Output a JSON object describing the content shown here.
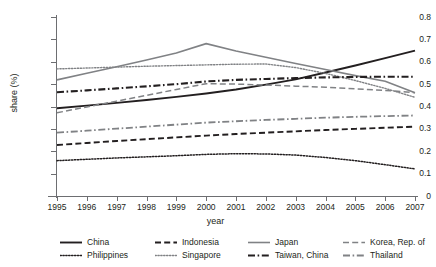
{
  "chart_data": {
    "type": "line",
    "title": "",
    "xlabel": "year",
    "ylabel": "share (%)",
    "x": [
      1995,
      1996,
      1997,
      1998,
      1999,
      2000,
      2001,
      2002,
      2003,
      2004,
      2005,
      2006,
      2007
    ],
    "xtick_labels": [
      "1995",
      "1996",
      "1997",
      "1998",
      "1999",
      "2000",
      "2001",
      "2002",
      "2003",
      "2004",
      "2005",
      "2006",
      "2007"
    ],
    "ytick_labels": [
      "0",
      "0.1",
      "0.2",
      "0.3",
      "0.4",
      "0.5",
      "0.6",
      "0.7",
      "0.8"
    ],
    "ylim": [
      0,
      0.8
    ],
    "xlim": [
      1995,
      2007
    ],
    "grid": false,
    "legend_position": "bottom",
    "series": [
      {
        "name": "China",
        "style": "solid",
        "color": "#231f20",
        "width": 1.9,
        "values": [
          0.392,
          0.404,
          0.416,
          0.429,
          0.443,
          0.458,
          0.476,
          0.498,
          0.521,
          0.552,
          0.583,
          0.616,
          0.65
        ]
      },
      {
        "name": "Indonesia",
        "style": "dashed",
        "color": "#231f20",
        "width": 1.9,
        "values": [
          0.228,
          0.237,
          0.246,
          0.254,
          0.262,
          0.27,
          0.277,
          0.283,
          0.289,
          0.295,
          0.3,
          0.305,
          0.31
        ]
      },
      {
        "name": "Japan",
        "style": "solid",
        "color": "#808285",
        "width": 1.6,
        "values": [
          0.519,
          0.549,
          0.578,
          0.608,
          0.639,
          0.681,
          0.648,
          0.62,
          0.592,
          0.565,
          0.538,
          0.513,
          0.462
        ]
      },
      {
        "name": "Korea, Rep. of",
        "style": "dashed",
        "color": "#808285",
        "width": 1.5,
        "values": [
          0.372,
          0.398,
          0.424,
          0.45,
          0.476,
          0.502,
          0.5,
          0.496,
          0.491,
          0.486,
          0.479,
          0.472,
          0.462
        ]
      },
      {
        "name": "Philippines",
        "style": "dotted",
        "color": "#231f20",
        "width": 1.5,
        "values": [
          0.158,
          0.164,
          0.17,
          0.175,
          0.18,
          0.186,
          0.189,
          0.188,
          0.183,
          0.172,
          0.158,
          0.14,
          0.121
        ]
      },
      {
        "name": "Singapore",
        "style": "dotted",
        "color": "#808285",
        "width": 1.4,
        "values": [
          0.568,
          0.572,
          0.576,
          0.58,
          0.583,
          0.586,
          0.589,
          0.59,
          0.574,
          0.548,
          0.516,
          0.481,
          0.441
        ]
      },
      {
        "name": "Taiwan, China",
        "style": "dashdot",
        "color": "#231f20",
        "width": 2.1,
        "values": [
          0.464,
          0.472,
          0.481,
          0.49,
          0.5,
          0.512,
          0.519,
          0.523,
          0.527,
          0.53,
          0.532,
          0.533,
          0.533
        ]
      },
      {
        "name": "Thailand",
        "style": "dashdot",
        "color": "#808285",
        "width": 1.8,
        "values": [
          0.283,
          0.292,
          0.301,
          0.31,
          0.319,
          0.328,
          0.334,
          0.34,
          0.345,
          0.35,
          0.354,
          0.357,
          0.36
        ]
      }
    ]
  },
  "legend": {
    "entries": [
      {
        "label": "China"
      },
      {
        "label": "Indonesia"
      },
      {
        "label": "Japan"
      },
      {
        "label": "Korea, Rep. of"
      },
      {
        "label": "Philippines"
      },
      {
        "label": "Singapore"
      },
      {
        "label": "Taiwan, China"
      },
      {
        "label": "Thailand"
      }
    ]
  },
  "colors": {
    "ink": "#231f20",
    "gray": "#808285",
    "axis": "#6d6e71",
    "background": "#ffffff"
  }
}
